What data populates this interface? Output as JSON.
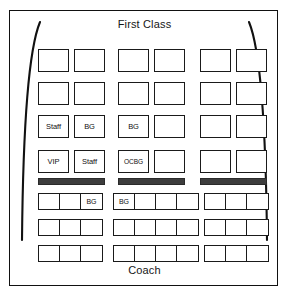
{
  "diagram": {
    "title_top": "First Class",
    "title_bottom": "Coach",
    "colors": {
      "frame": "#111111",
      "seat_outline": "#1a1a1a",
      "divider_bar": "#3d3d3d",
      "background": "#ffffff",
      "text": "#111111"
    }
  },
  "first_class": {
    "label": "First Class",
    "columns": [
      {
        "id": "left",
        "seats_per_row": 2,
        "rows": [
          {
            "row": 1,
            "seats": [
              "",
              ""
            ]
          },
          {
            "row": 2,
            "seats": [
              "",
              ""
            ]
          },
          {
            "row": 3,
            "seats": [
              "Staff",
              "BG"
            ]
          },
          {
            "row": 4,
            "seats": [
              "VIP",
              "Staff"
            ]
          }
        ]
      },
      {
        "id": "center",
        "seats_per_row": 2,
        "rows": [
          {
            "row": 1,
            "seats": [
              "",
              ""
            ]
          },
          {
            "row": 2,
            "seats": [
              "",
              ""
            ]
          },
          {
            "row": 3,
            "seats": [
              "BG",
              ""
            ]
          },
          {
            "row": 4,
            "seats": [
              "OCBG",
              ""
            ]
          }
        ]
      },
      {
        "id": "right",
        "seats_per_row": 2,
        "rows": [
          {
            "row": 1,
            "seats": [
              "",
              ""
            ]
          },
          {
            "row": 2,
            "seats": [
              "",
              ""
            ]
          },
          {
            "row": 3,
            "seats": [
              "",
              ""
            ]
          },
          {
            "row": 4,
            "seats": [
              "",
              ""
            ]
          }
        ]
      }
    ]
  },
  "divider": {
    "name": "exit-row-bar",
    "count": 3,
    "color": "#3d3d3d"
  },
  "coach": {
    "label": "Coach",
    "columns": [
      {
        "id": "left",
        "seats_per_row": 3,
        "rows": [
          {
            "row": 1,
            "seats": [
              "",
              "",
              "BG"
            ]
          },
          {
            "row": 2,
            "seats": [
              "",
              "",
              ""
            ]
          },
          {
            "row": 3,
            "seats": [
              "",
              "",
              ""
            ]
          }
        ]
      },
      {
        "id": "center",
        "seats_per_row": 4,
        "rows": [
          {
            "row": 1,
            "seats": [
              "BG",
              "",
              "",
              ""
            ]
          },
          {
            "row": 2,
            "seats": [
              "",
              "",
              "",
              ""
            ]
          },
          {
            "row": 3,
            "seats": [
              "",
              "",
              "",
              ""
            ]
          }
        ]
      },
      {
        "id": "right",
        "seats_per_row": 3,
        "rows": [
          {
            "row": 1,
            "seats": [
              "",
              "",
              ""
            ]
          },
          {
            "row": 2,
            "seats": [
              "",
              "",
              ""
            ]
          },
          {
            "row": 3,
            "seats": [
              "",
              "",
              ""
            ]
          }
        ]
      }
    ]
  }
}
